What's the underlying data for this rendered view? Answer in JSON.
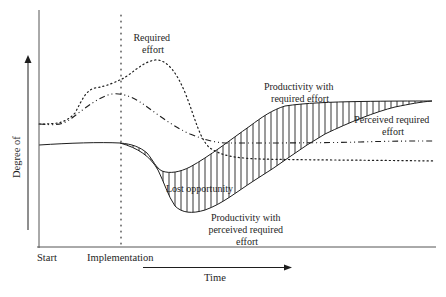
{
  "diagram": {
    "type": "conceptual-curve-diagram",
    "y_axis_label": "Degree of",
    "x_axis_label": "Time",
    "x_ticks": {
      "start": "Start",
      "implementation": "Implementation"
    },
    "annotations": {
      "required_effort": [
        "Required",
        "effort"
      ],
      "productivity_required": [
        "Productivity with",
        "required effort"
      ],
      "perceived_required": [
        "Perceived required",
        "effort"
      ],
      "lost_opportunity": "Lost opportunity",
      "productivity_perceived": [
        "Productivity with",
        "perceived required",
        "effort"
      ]
    },
    "curves": [
      {
        "name": "Required effort",
        "style": "dotted"
      },
      {
        "name": "Perceived required effort",
        "style": "dash-dot"
      },
      {
        "name": "Productivity with required effort",
        "style": "solid"
      },
      {
        "name": "Productivity with perceived required effort",
        "style": "solid"
      }
    ],
    "shaded_region": "Lost opportunity (vertical hatching between productivity curves)",
    "colors": {
      "ink": "#1e1e1e",
      "axis": "#555555",
      "background": "#ffffff"
    }
  }
}
